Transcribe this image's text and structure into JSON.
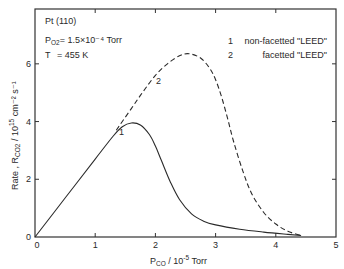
{
  "chart_data": {
    "type": "line",
    "title": "",
    "annotations": {
      "surface": "Pt (110)",
      "pressure_label": "P",
      "pressure_sub": "O2",
      "pressure_value": "= 1.5×10⁻⁴ Torr",
      "temperature_label": "T",
      "temperature_value": "= 455 K"
    },
    "xlabel": "P_CO / 10^-5 Torr",
    "xlabel_main": "P",
    "xlabel_sub": "CO",
    "xlabel_rest": " / 10",
    "xlabel_exp": "-5",
    "xlabel_unit": " Torr",
    "ylabel": "Rate, R_CO2 / 10^15 cm^-2 s^-1",
    "ylabel_main": "Rate , R",
    "ylabel_sub": "CO2",
    "ylabel_rest": " / 10",
    "ylabel_exp": "15",
    "ylabel_unit": " cm⁻² s⁻¹",
    "xlim": [
      0,
      5
    ],
    "ylim": [
      0,
      7.9
    ],
    "xticks": [
      "0",
      "1",
      "2",
      "3",
      "4",
      "5"
    ],
    "yticks": [
      "0",
      "2",
      "4",
      "6"
    ],
    "grid": false,
    "legend": {
      "position": "upper right",
      "entries": [
        {
          "id": "1",
          "label": "non-facetted \"LEED\"",
          "style": "solid"
        },
        {
          "id": "2",
          "label": "facetted \"LEED\"",
          "style": "dashed"
        }
      ]
    },
    "series": [
      {
        "name": "1 non-facetted \"LEED\"",
        "style": "solid",
        "x": [
          0,
          0.5,
          1.0,
          1.3,
          1.45,
          1.6,
          1.75,
          1.9,
          2.0,
          2.1,
          2.25,
          2.4,
          2.6,
          2.8,
          3.0,
          3.4,
          3.8,
          4.2,
          4.42
        ],
        "y": [
          0,
          1.35,
          2.7,
          3.5,
          3.82,
          3.95,
          3.88,
          3.55,
          3.15,
          2.65,
          1.9,
          1.3,
          0.8,
          0.55,
          0.42,
          0.27,
          0.17,
          0.09,
          0.05
        ]
      },
      {
        "name": "2 facetted \"LEED\"",
        "style": "dashed",
        "x": [
          1.35,
          1.6,
          1.8,
          2.0,
          2.2,
          2.4,
          2.56,
          2.75,
          2.9,
          3.0,
          3.1,
          3.2,
          3.3,
          3.45,
          3.6,
          3.8,
          4.0,
          4.2,
          4.42
        ],
        "y": [
          3.7,
          4.45,
          5.05,
          5.6,
          6.0,
          6.28,
          6.35,
          6.2,
          5.85,
          5.45,
          4.85,
          4.1,
          3.3,
          2.3,
          1.5,
          0.85,
          0.45,
          0.2,
          0.05
        ]
      }
    ],
    "curve_labels": [
      "1",
      "2"
    ]
  }
}
